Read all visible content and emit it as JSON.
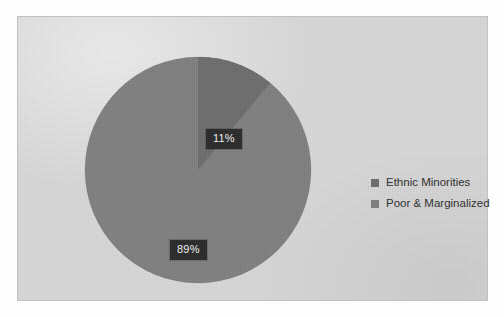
{
  "chart_data": {
    "type": "pie",
    "title": "",
    "categories": [
      "Ethnic Minorities",
      "Poor & Marginalized"
    ],
    "values": [
      11,
      89
    ],
    "value_labels": [
      "11%",
      "89%"
    ],
    "colors": [
      "#6e6e6e",
      "#808080"
    ],
    "legend_position": "right",
    "grid": false,
    "start_angle_deg": 0,
    "direction": "clockwise"
  },
  "panel": {
    "background_color": "#d8d8d8",
    "border_color": "#c2c2c2"
  },
  "labels": {
    "slice_minorities": "11%",
    "slice_poor": "89%",
    "label_background": "#2b2b2b",
    "label_text_color": "#f2f2f2"
  },
  "legend": {
    "items": [
      {
        "label": "Ethnic Minorities",
        "color": "#6e6e6e"
      },
      {
        "label": "Poor & Marginalized",
        "color": "#808080"
      }
    ]
  }
}
